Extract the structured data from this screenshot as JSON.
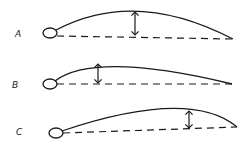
{
  "figure": {
    "profiles": [
      {
        "label": "A",
        "caption": "Maximum camber at mid-chord, large camber"
      },
      {
        "label": "B",
        "caption": "Maximum camber forward, smaller camber"
      },
      {
        "label": "C",
        "caption": "Maximum camber aft"
      }
    ]
  },
  "colors": {
    "stroke": "#1a1a1a",
    "background": "#ffffff"
  }
}
